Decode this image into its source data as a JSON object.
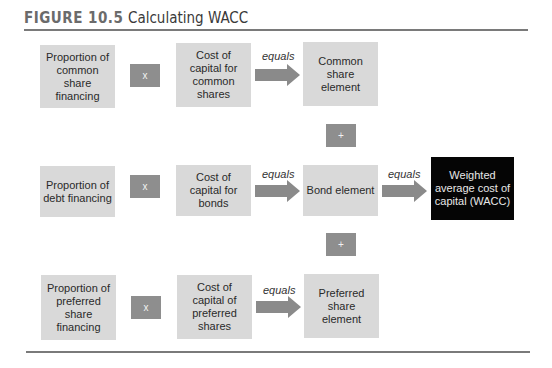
{
  "header": {
    "figure_number": "FIGURE 10.5",
    "figure_title": "Calculating WACC"
  },
  "rows": [
    {
      "proportion": "Proportion of common share financing",
      "operator": "x",
      "cost": "Cost of capital for common shares",
      "equals": "equals",
      "element": "Common share element"
    },
    {
      "proportion": "Proportion of debt financing",
      "operator": "x",
      "cost": "Cost of capital for bonds",
      "equals": "equals",
      "element": "Bond element"
    },
    {
      "proportion": "Proportion of preferred share financing",
      "operator": "x",
      "cost": "Cost of capital of preferred shares",
      "equals": "equals",
      "element": "Preferred share element"
    }
  ],
  "plus_operators": [
    "+",
    "+"
  ],
  "result": {
    "equals": "equals",
    "label": "Weighted average cost of capital (WACC)"
  },
  "colors": {
    "box_fill": "#d9d9d9",
    "operator_fill": "#8e8e8e",
    "arrow_fill": "#8a8a8a",
    "result_fill": "#050505",
    "rule": "#7a7a7a"
  }
}
